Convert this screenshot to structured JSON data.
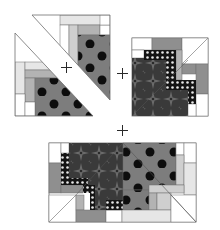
{
  "diagram": {
    "kind": "quilt block assembly diagram",
    "colors": {
      "background": "#ffffff",
      "outline": "#6e6e6e",
      "white_fabric": "#ffffff",
      "very_light": "#e6e6e6",
      "light": "#cfcfcf",
      "medium_light": "#b3b3b3",
      "medium": "#8f8f8f",
      "polka_fabric": "#7d7d7d",
      "polka_dot": "#0d0d0d",
      "dark_print": "#3a3a3a",
      "dark_print_motif": "#6a6a6a",
      "dotted_border": "#141414",
      "dotted_dot": "#e8e8e8"
    },
    "operators": [
      {
        "symbol": "+",
        "x": 61,
        "y": 62
      },
      {
        "symbol": "+",
        "x": 117,
        "y": 68
      },
      {
        "symbol": "+",
        "x": 117,
        "y": 125
      }
    ],
    "pieces": [
      {
        "name": "upper-right-triangle-unit",
        "shape": "half-square triangle",
        "fabric": "polka dot"
      },
      {
        "name": "lower-left-triangle-unit",
        "shape": "half-square triangle",
        "fabric": "polka dot"
      },
      {
        "name": "quarter-block-unit",
        "shape": "square",
        "fabric": "dark star print with dotted border"
      },
      {
        "name": "assembled-half-block",
        "shape": "rectangle",
        "fabric": "combined"
      }
    ]
  }
}
